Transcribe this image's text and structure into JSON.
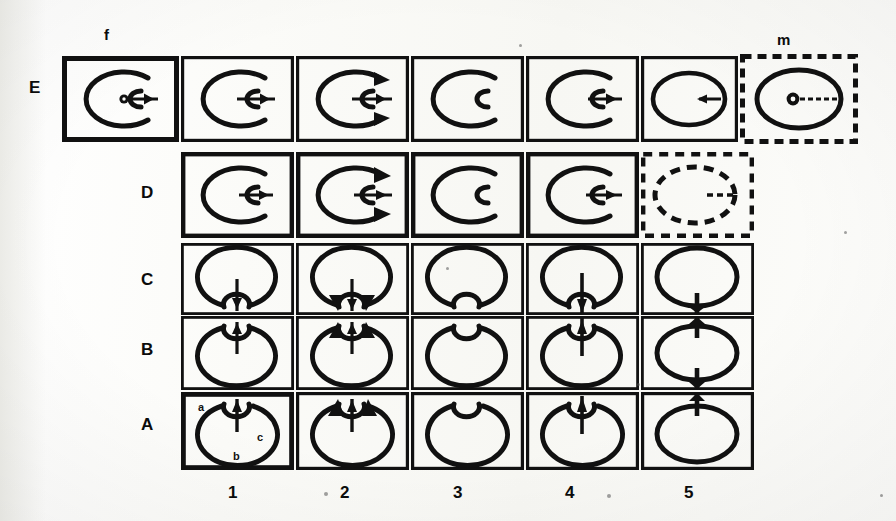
{
  "figure": {
    "kind": "scanned-grid-figure",
    "row_labels": [
      "E",
      "D",
      "C",
      "B",
      "A"
    ],
    "column_labels": [
      "1",
      "2",
      "3",
      "4",
      "5"
    ],
    "top_labels": {
      "left": "f",
      "right": "m"
    },
    "inner_annotations": {
      "a": "a",
      "b": "b",
      "c": "c"
    },
    "colors": {
      "ink": "#111111",
      "paper": "#fdfdfb"
    }
  },
  "rows": {
    "E": {
      "label": "E",
      "cell_count": 7,
      "cells": [
        {
          "name": "E-f",
          "border": "solid",
          "shape": "c-ellipse-open-right",
          "inner": "small-c-open-right",
          "nucleus": "dot",
          "arrow": "right",
          "arrowheads": "none"
        },
        {
          "name": "E-2",
          "border": "solid",
          "shape": "c-ellipse-open-right",
          "inner": "small-c-open-right",
          "nucleus": "none",
          "arrow": "right",
          "arrowheads": "none"
        },
        {
          "name": "E-3",
          "border": "solid",
          "shape": "c-ellipse-open-right",
          "inner": "small-c-open-right",
          "nucleus": "none",
          "arrow": "right",
          "arrowheads": "both-tips"
        },
        {
          "name": "E-4",
          "border": "solid",
          "shape": "c-ellipse-open-right",
          "inner": "small-c-open-right",
          "nucleus": "none",
          "arrow": "none",
          "arrowheads": "none"
        },
        {
          "name": "E-5",
          "border": "solid",
          "shape": "c-ellipse-open-right",
          "inner": "small-c-open-right",
          "nucleus": "none",
          "arrow": "right",
          "arrowheads": "none"
        },
        {
          "name": "E-6",
          "border": "solid",
          "shape": "closed-ellipse",
          "inner": "none",
          "nucleus": "none",
          "arrow": "left",
          "arrowheads": "none"
        },
        {
          "name": "E-m",
          "border": "dashed",
          "shape": "closed-ellipse",
          "inner": "none",
          "nucleus": "ring-dot",
          "arrow": "right-dashed",
          "arrowheads": "none"
        }
      ]
    },
    "D": {
      "label": "D",
      "cell_count": 5,
      "cells": [
        {
          "name": "D-1",
          "border": "solid",
          "shape": "c-ellipse-open-right",
          "inner": "small-c-open-right",
          "arrow": "right",
          "arrowheads": "none"
        },
        {
          "name": "D-2",
          "border": "solid",
          "shape": "c-ellipse-open-right",
          "inner": "small-c-open-right",
          "arrow": "right",
          "arrowheads": "both-tips"
        },
        {
          "name": "D-3",
          "border": "solid",
          "shape": "c-ellipse-open-right",
          "inner": "small-c-open-right",
          "arrow": "none",
          "arrowheads": "none"
        },
        {
          "name": "D-4",
          "border": "solid",
          "shape": "c-ellipse-open-right",
          "inner": "small-c-open-right",
          "arrow": "right",
          "arrowheads": "none"
        },
        {
          "name": "D-5",
          "border": "dashed",
          "shape": "closed-ellipse-dashed",
          "inner": "none",
          "arrow": "right-dashed",
          "arrowheads": "none"
        }
      ]
    },
    "C": {
      "label": "C",
      "cell_count": 5,
      "cells": [
        {
          "name": "C-1",
          "shape": "ellipse-open-bottom",
          "inner": "small-arc-bottom",
          "arrow": "down",
          "arrowheads": "none"
        },
        {
          "name": "C-2",
          "shape": "ellipse-open-bottom",
          "inner": "small-arc-bottom",
          "arrow": "down",
          "arrowheads": "both-tips"
        },
        {
          "name": "C-3",
          "shape": "ellipse-open-bottom",
          "inner": "small-arc-bottom",
          "arrow": "none",
          "arrowheads": "none"
        },
        {
          "name": "C-4",
          "shape": "ellipse-open-bottom",
          "inner": "small-arc-bottom",
          "arrow": "down",
          "arrowheads": "none"
        },
        {
          "name": "C-5",
          "shape": "closed-ellipse-necked",
          "inner": "none",
          "arrow": "neck-bar",
          "arrowheads": "none"
        }
      ]
    },
    "B": {
      "label": "B",
      "cell_count": 5,
      "cells": [
        {
          "name": "B-1",
          "shape": "ellipse-open-top",
          "inner": "small-arc-top",
          "arrow": "up",
          "arrowheads": "none"
        },
        {
          "name": "B-2",
          "shape": "ellipse-open-top",
          "inner": "small-arc-top",
          "arrow": "up",
          "arrowheads": "both-tips"
        },
        {
          "name": "B-3",
          "shape": "ellipse-open-top",
          "inner": "small-arc-top",
          "arrow": "none",
          "arrowheads": "none"
        },
        {
          "name": "B-4",
          "shape": "ellipse-open-top",
          "inner": "small-arc-top",
          "arrow": "up",
          "arrowheads": "none"
        },
        {
          "name": "B-5",
          "shape": "closed-ellipse-necked",
          "inner": "none",
          "arrow": "neck-bar-both",
          "arrowheads": "none"
        }
      ]
    },
    "A": {
      "label": "A",
      "cell_count": 5,
      "cells": [
        {
          "name": "A-1",
          "shape": "ellipse-open-top",
          "inner": "small-arc-top",
          "arrow": "up",
          "arrowheads": "none",
          "labels": [
            "a",
            "c",
            "b"
          ]
        },
        {
          "name": "A-2",
          "shape": "ellipse-open-top",
          "inner": "small-arc-top",
          "arrow": "up",
          "arrowheads": "both-tips"
        },
        {
          "name": "A-3",
          "shape": "ellipse-open-top",
          "inner": "small-arc-top",
          "arrow": "none",
          "arrowheads": "none"
        },
        {
          "name": "A-4",
          "shape": "ellipse-open-top",
          "inner": "small-arc-top",
          "arrow": "up",
          "arrowheads": "none"
        },
        {
          "name": "A-5",
          "shape": "closed-ellipse-necked",
          "inner": "none",
          "arrow": "neck-bar-top",
          "arrowheads": "none"
        }
      ]
    }
  }
}
